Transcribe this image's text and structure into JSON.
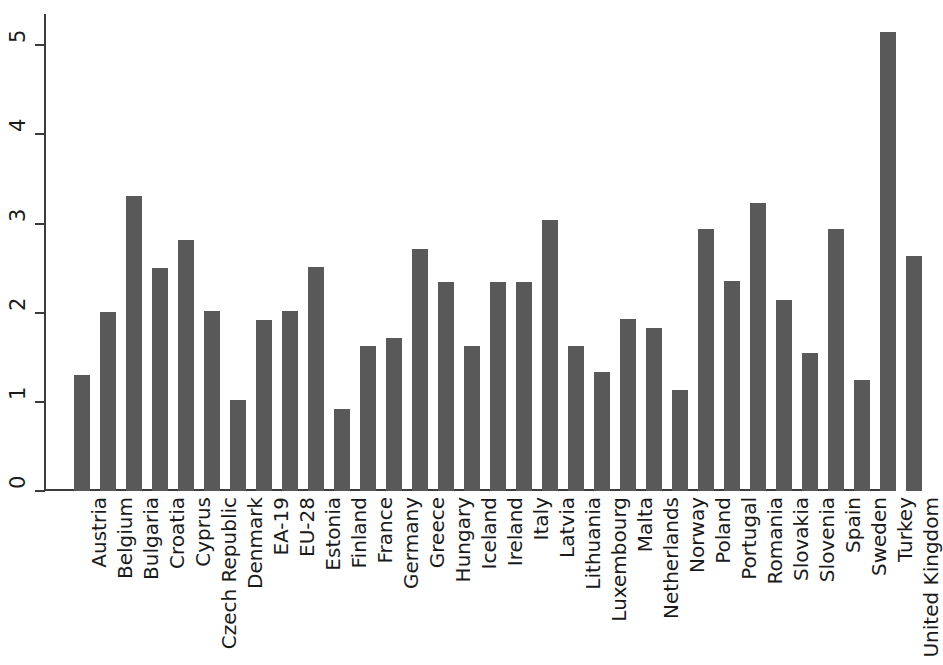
{
  "chart_data": {
    "type": "bar",
    "title": "",
    "subtitle": "",
    "xlabel": "",
    "ylabel": "",
    "ylim": [
      0,
      5.35
    ],
    "yticks": [
      0,
      1,
      2,
      3,
      4,
      5
    ],
    "ytick_labels": [
      "0",
      "1",
      "2",
      "3",
      "4",
      "5"
    ],
    "grid": false,
    "legend": null,
    "bar_color": "#595959",
    "axis_color": "#3c3c3c",
    "background_color": "#ffffff",
    "categories": [
      "Austria",
      "Belgium",
      "Bulgaria",
      "Croatia",
      "Cyprus",
      "Czech Republic",
      "Denmark",
      "EA-19",
      "EU-28",
      "Estonia",
      "Finland",
      "France",
      "Germany",
      "Greece",
      "Hungary",
      "Iceland",
      "Ireland",
      "Italy",
      "Latvia",
      "Lithuania",
      "Luxembourg",
      "Malta",
      "Netherlands",
      "Norway",
      "Poland",
      "Portugal",
      "Romania",
      "Slovakia",
      "Slovenia",
      "Spain",
      "Sweden",
      "Turkey",
      "United Kingdom"
    ],
    "values": [
      1.3,
      2.01,
      3.31,
      2.5,
      2.81,
      2.02,
      1.02,
      1.92,
      2.02,
      2.51,
      0.92,
      1.63,
      1.72,
      2.72,
      2.34,
      1.63,
      2.34,
      2.34,
      3.04,
      1.63,
      1.34,
      1.93,
      1.83,
      1.13,
      2.94,
      2.35,
      3.23,
      2.14,
      1.55,
      2.94,
      1.24,
      5.15,
      2.64
    ]
  }
}
